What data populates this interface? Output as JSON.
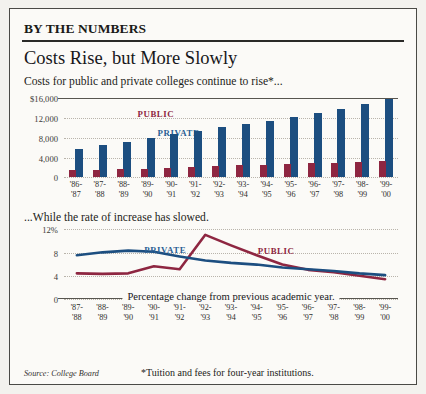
{
  "header": {
    "kicker": "BY THE NUMBERS",
    "headline": "Costs Rise, but More Slowly",
    "deck": "Costs for public and private colleges continue to rise*..."
  },
  "subhead": "...While the rate of increase has slowed.",
  "line_caption": "Percentage change from previous academic year.",
  "footer": {
    "source": "Source: College Board",
    "footnote": "*Tuition and fees for four-year institutions."
  },
  "colors": {
    "public": "#8e2641",
    "private": "#1c4e80",
    "frame": "#4a4a46",
    "paper": "#fbfaf7"
  },
  "legend": {
    "public": "PUBLIC",
    "private": "PRIVATE"
  },
  "chart_data": [
    {
      "type": "bar",
      "title": "Costs for public and private colleges continue to rise*...",
      "xlabel": "",
      "ylabel": "",
      "ylim": [
        0,
        16000
      ],
      "yticks": [
        "$16,000",
        "12,000",
        "8,000",
        "4,000",
        "0"
      ],
      "ytick_values": [
        16000,
        12000,
        8000,
        4000,
        0
      ],
      "grid": true,
      "legend": [
        "PUBLIC",
        "PRIVATE"
      ],
      "categories": [
        "'86-\n'87",
        "'87-\n'88",
        "'88-\n'89",
        "'89-\n'90",
        "'90-\n'91",
        "'91-\n'92",
        "'92-\n'93",
        "'93-\n'94",
        "'94-\n'95",
        "'95-\n'96",
        "'96-\n'97",
        "'97-\n'98",
        "'98-\n'99",
        "'99-\n'00"
      ],
      "categories_top": [
        "'86-",
        "'87-",
        "'88-",
        "'89-",
        "'90-",
        "'91-",
        "'92-",
        "'93-",
        "'94-",
        "'95-",
        "'96-",
        "'97-",
        "'98-",
        "'99-"
      ],
      "categories_bottom": [
        "'87",
        "'88",
        "'89",
        "'90",
        "'91",
        "'92",
        "'93",
        "'94",
        "'95",
        "'96",
        "'97",
        "'98",
        "'99",
        "'00"
      ],
      "series": [
        {
          "name": "PUBLIC",
          "color": "#8e2641",
          "values": [
            1400,
            1500,
            1600,
            1700,
            1850,
            2050,
            2300,
            2450,
            2550,
            2700,
            2850,
            3000,
            3200,
            3400
          ]
        },
        {
          "name": "PRIVATE",
          "color": "#1c4e80",
          "values": [
            5700,
            6450,
            7200,
            8000,
            8700,
            9400,
            10100,
            10800,
            11500,
            12200,
            13000,
            13800,
            14800,
            15900
          ]
        }
      ]
    },
    {
      "type": "line",
      "title": "...While the rate of increase has slowed.",
      "caption": "Percentage change from previous academic year.",
      "xlabel": "",
      "ylabel": "",
      "ylim": [
        0,
        12
      ],
      "yticks": [
        "12%",
        "8",
        "4",
        "0"
      ],
      "ytick_values": [
        12,
        8,
        4,
        0
      ],
      "grid": true,
      "legend": [
        "PUBLIC",
        "PRIVATE"
      ],
      "categories": [
        "'87-\n'88",
        "'88-\n'89",
        "'89-\n'90",
        "'90-\n'91",
        "'91-\n'92",
        "'92-\n'93",
        "'93-\n'94",
        "'94-\n'95",
        "'95-\n'96",
        "'96-\n'97",
        "'97-\n'98",
        "'98-\n'99",
        "'99-\n'00"
      ],
      "categories_top": [
        "'87-",
        "'88-",
        "'89-",
        "'90-",
        "'91-",
        "'92-",
        "'93-",
        "'94-",
        "'95-",
        "'96-",
        "'97-",
        "'98-",
        "'99-"
      ],
      "categories_bottom": [
        "'88",
        "'89",
        "'90",
        "'91",
        "'92",
        "'93",
        "'94",
        "'95",
        "'96",
        "'97",
        "'98",
        "'99",
        "'00"
      ],
      "series": [
        {
          "name": "PUBLIC",
          "color": "#8e2641",
          "values": [
            4.4,
            4.3,
            4.4,
            5.6,
            5.1,
            11.0,
            9.2,
            7.5,
            5.9,
            5.0,
            4.6,
            4.0,
            3.4
          ]
        },
        {
          "name": "PRIVATE",
          "color": "#1c4e80",
          "values": [
            7.5,
            8.0,
            8.3,
            8.1,
            7.3,
            6.6,
            6.2,
            5.9,
            5.4,
            5.1,
            4.8,
            4.4,
            4.1
          ]
        }
      ]
    }
  ]
}
